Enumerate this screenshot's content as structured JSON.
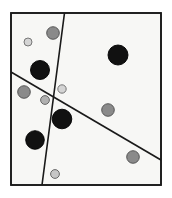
{
  "figure": {
    "title": "",
    "canvas": {
      "width": 172,
      "height": 198,
      "background": "#ffffff"
    },
    "frame": {
      "label": "plot-border",
      "x": 11,
      "y": 13,
      "width": 150,
      "height": 172,
      "stroke": "#1a1a1a",
      "stroke_width": 1.6,
      "fill": "#f7f7f5"
    },
    "lines": [
      {
        "label": "steep-dividing-line",
        "x1": 64.5,
        "y1": 13,
        "x2": 42.0,
        "y2": 185,
        "stroke": "#1a1a1a",
        "stroke_width": 1.6
      },
      {
        "label": "shallow-dividing-line",
        "x1": 11,
        "y1": 72,
        "x2": 161,
        "y2": 160,
        "stroke": "#1a1a1a",
        "stroke_width": 1.6
      }
    ],
    "points": [
      {
        "label": "point-gray-top",
        "cx": 53,
        "cy": 33,
        "r": 6.3,
        "fill": "#8a8a8a",
        "stroke": "#4d4d4d"
      },
      {
        "label": "point-light-topleft",
        "cx": 28,
        "cy": 42,
        "r": 4.0,
        "fill": "#d4d4d4",
        "stroke": "#6b6b6b"
      },
      {
        "label": "point-black-upperleft",
        "cx": 40,
        "cy": 70,
        "r": 9.5,
        "fill": "#111111",
        "stroke": "#000000"
      },
      {
        "label": "point-black-upperright",
        "cx": 118,
        "cy": 55,
        "r": 10.0,
        "fill": "#111111",
        "stroke": "#000000"
      },
      {
        "label": "point-gray-left",
        "cx": 24,
        "cy": 92,
        "r": 6.3,
        "fill": "#8a8a8a",
        "stroke": "#4d4d4d"
      },
      {
        "label": "point-light-center",
        "cx": 62,
        "cy": 89,
        "r": 4.2,
        "fill": "#d4d4d4",
        "stroke": "#6b6b6b"
      },
      {
        "label": "point-gray-small-mid",
        "cx": 45,
        "cy": 100,
        "r": 4.4,
        "fill": "#b0b0b0",
        "stroke": "#5a5a5a"
      },
      {
        "label": "point-black-center",
        "cx": 62,
        "cy": 119,
        "r": 9.8,
        "fill": "#111111",
        "stroke": "#000000"
      },
      {
        "label": "point-gray-right",
        "cx": 108,
        "cy": 110,
        "r": 6.3,
        "fill": "#8a8a8a",
        "stroke": "#4d4d4d"
      },
      {
        "label": "point-black-lowerleft",
        "cx": 35,
        "cy": 140,
        "r": 9.3,
        "fill": "#111111",
        "stroke": "#000000"
      },
      {
        "label": "point-gray-lowerright",
        "cx": 133,
        "cy": 157,
        "r": 6.3,
        "fill": "#8a8a8a",
        "stroke": "#4d4d4d"
      },
      {
        "label": "point-light-bottom",
        "cx": 55,
        "cy": 174,
        "r": 4.4,
        "fill": "#c6c6c6",
        "stroke": "#5a5a5a"
      }
    ]
  },
  "chart_data": {
    "type": "scatter",
    "title": "",
    "xlabel": "",
    "ylabel": "",
    "grid": false,
    "legend_position": "none",
    "xlim": [
      0,
      150
    ],
    "ylim": [
      0,
      172
    ],
    "note": "Scatter of 12 markers inside a rectangular frame, partitioned by two straight dividing lines. Marker classes encoded by fill shade and size.",
    "classes": [
      {
        "name": "large-black",
        "fill": "#111111",
        "radius": 10,
        "count": 4
      },
      {
        "name": "medium-gray",
        "fill": "#8a8a8a",
        "radius": 6,
        "count": 4
      },
      {
        "name": "small-light",
        "fill": "#d4d4d4",
        "radius": 4,
        "count": 4
      }
    ],
    "series": [
      {
        "name": "large-black",
        "points": [
          {
            "x": 29,
            "y": 115
          },
          {
            "x": 107,
            "y": 130
          },
          {
            "x": 51,
            "y": 66
          },
          {
            "x": 24,
            "y": 45
          }
        ]
      },
      {
        "name": "medium-gray",
        "points": [
          {
            "x": 42,
            "y": 152
          },
          {
            "x": 13,
            "y": 93
          },
          {
            "x": 97,
            "y": 75
          },
          {
            "x": 122,
            "y": 28
          }
        ]
      },
      {
        "name": "small-light",
        "points": [
          {
            "x": 17,
            "y": 143
          },
          {
            "x": 51,
            "y": 96
          },
          {
            "x": 34,
            "y": 85
          },
          {
            "x": 44,
            "y": 11
          }
        ]
      }
    ],
    "dividing_lines": [
      {
        "name": "steep-dividing-line",
        "from": {
          "x": 53.5,
          "y": 172
        },
        "to": {
          "x": 31,
          "y": 0
        }
      },
      {
        "name": "shallow-dividing-line",
        "from": {
          "x": 0,
          "y": 113
        },
        "to": {
          "x": 150,
          "y": 25
        }
      }
    ]
  }
}
